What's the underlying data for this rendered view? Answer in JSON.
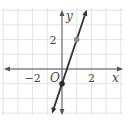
{
  "chart_data": {
    "type": "line",
    "title": "",
    "xlabel": "x",
    "ylabel": "y",
    "origin_label": "O",
    "xlim": [
      -4,
      4
    ],
    "ylim": [
      -3,
      4
    ],
    "grid": true,
    "x_tick_labels": [
      {
        "value": -2,
        "label": "−2"
      },
      {
        "value": 2,
        "label": "2"
      }
    ],
    "y_tick_labels": [
      {
        "value": 2,
        "label": "2"
      }
    ],
    "series": [
      {
        "name": "line",
        "equation": "y = 3x - 1",
        "slope": 3,
        "intercept": -1,
        "color": "#333333",
        "arrows": "both"
      }
    ],
    "points": [
      {
        "x": 0,
        "y": -1,
        "color": "#2b2b2b"
      },
      {
        "x": 1,
        "y": 2,
        "color": "#8c8c8c"
      }
    ]
  }
}
